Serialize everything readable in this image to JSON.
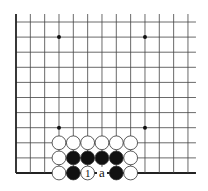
{
  "diagram": {
    "type": "go-board-fragment",
    "board_edges": [
      "left",
      "bottom"
    ],
    "grid": {
      "columns": 13,
      "rows": 11,
      "origin_x": 16,
      "origin_y": 22,
      "spacing_x": 14.33,
      "spacing_y": 15.1,
      "line_color": "#444444",
      "edge_color": "#222222"
    },
    "star_points": [
      {
        "col": 3,
        "row": 1
      },
      {
        "col": 9,
        "row": 1
      },
      {
        "col": 3,
        "row": 7
      },
      {
        "col": 9,
        "row": 7
      }
    ],
    "stones": [
      {
        "col": 3,
        "row": 8,
        "color": "white"
      },
      {
        "col": 4,
        "row": 8,
        "color": "white"
      },
      {
        "col": 5,
        "row": 8,
        "color": "white"
      },
      {
        "col": 6,
        "row": 8,
        "color": "white"
      },
      {
        "col": 7,
        "row": 8,
        "color": "white"
      },
      {
        "col": 8,
        "row": 8,
        "color": "white"
      },
      {
        "col": 3,
        "row": 9,
        "color": "white"
      },
      {
        "col": 4,
        "row": 9,
        "color": "black"
      },
      {
        "col": 5,
        "row": 9,
        "color": "black"
      },
      {
        "col": 6,
        "row": 9,
        "color": "black"
      },
      {
        "col": 7,
        "row": 9,
        "color": "black"
      },
      {
        "col": 8,
        "row": 9,
        "color": "white"
      },
      {
        "col": 3,
        "row": 10,
        "color": "white"
      },
      {
        "col": 4,
        "row": 10,
        "color": "black"
      },
      {
        "col": 5,
        "row": 10,
        "color": "white",
        "label": "1"
      },
      {
        "col": 7,
        "row": 10,
        "color": "black"
      },
      {
        "col": 8,
        "row": 10,
        "color": "white"
      }
    ],
    "point_labels": [
      {
        "col": 6,
        "row": 10,
        "label": "a"
      }
    ],
    "colors": {
      "black_stone": "#111111",
      "white_stone": "#ffffff",
      "stone_outline": "#333333",
      "background": "#ffffff"
    }
  }
}
